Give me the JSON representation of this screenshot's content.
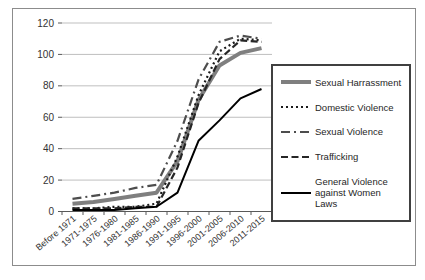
{
  "chart_data": {
    "type": "line",
    "title": "",
    "xlabel": "",
    "ylabel": "",
    "categories": [
      "Before 1971",
      "1971-1975",
      "1976-1980",
      "1981-1985",
      "1986-1990",
      "1991-1995",
      "1996-2000",
      "2001-2005",
      "2006-2010",
      "2011-2015"
    ],
    "series": [
      {
        "name": "Sexual Harrassment",
        "values": [
          5,
          6,
          8,
          10,
          12,
          32,
          71,
          93,
          101,
          104
        ],
        "color": "#7f7f7f",
        "width": 4,
        "dash": ""
      },
      {
        "name": "Domestic Violence",
        "values": [
          2,
          2,
          3,
          3,
          5,
          35,
          74,
          102,
          110,
          109
        ],
        "color": "#1a1a1a",
        "width": 2.2,
        "dash": "2 3"
      },
      {
        "name": "Sexual Violence",
        "values": [
          8,
          10,
          12,
          15,
          17,
          45,
          84,
          108,
          112,
          110
        ],
        "color": "#4d4d4d",
        "width": 2.2,
        "dash": "9 4 2 4"
      },
      {
        "name": "Trafficking",
        "values": [
          2,
          2,
          2,
          3,
          3,
          28,
          69,
          97,
          109,
          108
        ],
        "color": "#262626",
        "width": 2.2,
        "dash": "7 3.5"
      },
      {
        "name": "General Violence against Women Laws",
        "values": [
          1,
          1,
          1,
          2,
          3,
          12,
          45,
          58,
          72,
          78
        ],
        "color": "#000000",
        "width": 2,
        "dash": ""
      }
    ],
    "ylim": [
      0,
      120
    ],
    "ytick_interval": 20,
    "yticks": [
      "0",
      "20",
      "40",
      "60",
      "80",
      "100",
      "120"
    ],
    "grid": true,
    "grid_color": "#bfbfbf",
    "axis_color": "#595959",
    "tick_label_color": "#333333",
    "legend_position": "right",
    "legend_border_color": "#404040"
  }
}
